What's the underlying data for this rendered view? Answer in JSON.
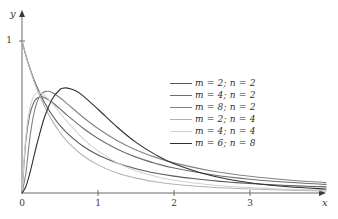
{
  "chart_data": {
    "type": "line",
    "title": "",
    "xlabel": "x",
    "ylabel": "y",
    "xlim": [
      0,
      4.1
    ],
    "ylim": [
      0,
      1.12
    ],
    "xticks": [
      0,
      1,
      2,
      3
    ],
    "xtick_labels": [
      "0",
      "1",
      "2",
      "3"
    ],
    "yticks": [
      1
    ],
    "ytick_labels": [
      "1"
    ],
    "grid": false,
    "legend_position": "upper-right-inside",
    "axis_style": "arrow-ended",
    "series": [
      {
        "name": "m = 2; n = 2",
        "m": 2,
        "n": 2,
        "color": "#5a5a5a",
        "x": [
          0,
          0.05,
          0.1,
          0.15,
          0.2,
          0.3,
          0.4,
          0.5,
          0.6,
          0.8,
          1.0,
          1.25,
          1.5,
          1.75,
          2.0,
          2.25,
          2.5,
          2.75,
          3.0,
          3.25,
          3.5,
          3.75,
          4.0
        ],
        "y": [
          1.0,
          0.907,
          0.826,
          0.756,
          0.694,
          0.592,
          0.51,
          0.444,
          0.391,
          0.309,
          0.25,
          0.198,
          0.16,
          0.132,
          0.111,
          0.095,
          0.082,
          0.071,
          0.0625,
          0.0554,
          0.0494,
          0.0443,
          0.04
        ]
      },
      {
        "name": "m = 4; n = 2",
        "m": 4,
        "n": 2,
        "color": "#6e6e6e",
        "x": [
          0,
          0.05,
          0.1,
          0.15,
          0.2,
          0.25,
          0.3,
          0.4,
          0.5,
          0.6,
          0.8,
          1.0,
          1.25,
          1.5,
          1.75,
          2.0,
          2.5,
          3.0,
          3.5,
          4.0
        ],
        "y": [
          0.0,
          0.339,
          0.51,
          0.591,
          0.625,
          0.633,
          0.627,
          0.595,
          0.553,
          0.509,
          0.428,
          0.359,
          0.29,
          0.236,
          0.196,
          0.164,
          0.12,
          0.0905,
          0.0708,
          0.0566
        ]
      },
      {
        "name": "m = 8; n = 2",
        "m": 8,
        "n": 2,
        "color": "#838383",
        "x": [
          0,
          0.05,
          0.1,
          0.15,
          0.2,
          0.25,
          0.3,
          0.35,
          0.4,
          0.5,
          0.6,
          0.8,
          1.0,
          1.25,
          1.5,
          1.75,
          2.0,
          2.5,
          3.0,
          3.5,
          4.0
        ],
        "y": [
          0.0,
          0.128,
          0.348,
          0.507,
          0.6,
          0.648,
          0.667,
          0.669,
          0.66,
          0.627,
          0.585,
          0.5,
          0.424,
          0.345,
          0.283,
          0.236,
          0.198,
          0.145,
          0.11,
          0.086,
          0.069
        ]
      },
      {
        "name": "m = 2; n = 4",
        "m": 2,
        "n": 4,
        "color": "#b3b3b3",
        "x": [
          0,
          0.05,
          0.1,
          0.15,
          0.2,
          0.3,
          0.4,
          0.5,
          0.6,
          0.8,
          1.0,
          1.25,
          1.5,
          1.75,
          2.0,
          2.5,
          3.0,
          3.5,
          4.0
        ],
        "y": [
          1.0,
          0.907,
          0.823,
          0.748,
          0.681,
          0.566,
          0.473,
          0.398,
          0.337,
          0.247,
          0.185,
          0.132,
          0.0977,
          0.0743,
          0.0579,
          0.0378,
          0.0262,
          0.019,
          0.0143
        ]
      },
      {
        "name": "m = 4; n = 4",
        "m": 4,
        "n": 4,
        "color": "#d2d2d2",
        "x": [
          0,
          0.05,
          0.1,
          0.15,
          0.2,
          0.25,
          0.3,
          0.4,
          0.5,
          0.6,
          0.8,
          1.0,
          1.25,
          1.5,
          1.75,
          2.0,
          2.5,
          3.0,
          3.5,
          4.0
        ],
        "y": [
          0.0,
          0.371,
          0.554,
          0.633,
          0.659,
          0.657,
          0.64,
          0.588,
          0.527,
          0.467,
          0.36,
          0.277,
          0.199,
          0.146,
          0.11,
          0.0844,
          0.0529,
          0.0354,
          0.0249,
          0.0183
        ]
      },
      {
        "name": "m = 6; n = 8",
        "m": 6,
        "n": 8,
        "color": "#2f2f2f",
        "x": [
          0,
          0.05,
          0.1,
          0.15,
          0.2,
          0.3,
          0.4,
          0.5,
          0.55,
          0.6,
          0.7,
          0.8,
          1.0,
          1.25,
          1.5,
          1.75,
          2.0,
          2.5,
          3.0,
          3.5,
          4.0
        ],
        "y": [
          0.0,
          0.041,
          0.124,
          0.226,
          0.329,
          0.505,
          0.62,
          0.681,
          0.69,
          0.69,
          0.674,
          0.641,
          0.551,
          0.434,
          0.333,
          0.254,
          0.193,
          0.113,
          0.0676,
          0.0416,
          0.0263
        ]
      }
    ]
  },
  "legend": {
    "entries": [
      {
        "label": "m = 2; n = 2",
        "color": "#5a5a5a"
      },
      {
        "label": "m = 4; n = 2",
        "color": "#6e6e6e"
      },
      {
        "label": "m = 8; n = 2",
        "color": "#838383"
      },
      {
        "label": "m = 2; n = 4",
        "color": "#b3b3b3"
      },
      {
        "label": "m = 4; n = 4",
        "color": "#d2d2d2"
      },
      {
        "label": "m = 6; n = 8",
        "color": "#2f2f2f"
      }
    ]
  },
  "axes": {
    "x_label": "x",
    "y_label": "y",
    "x_tick_labels": [
      "0",
      "1",
      "2",
      "3"
    ],
    "y_tick_labels": [
      "1"
    ],
    "axis_color": "#555555"
  }
}
